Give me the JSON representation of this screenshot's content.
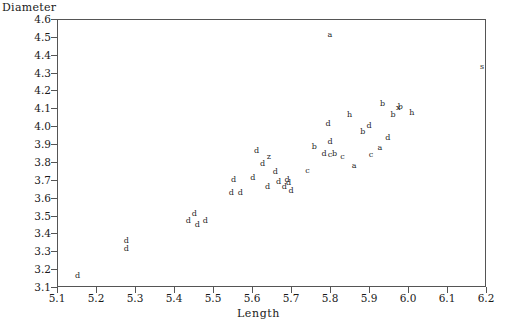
{
  "chart_data": {
    "type": "scatter",
    "title": "",
    "xlabel": "Length",
    "ylabel": "Diameter",
    "xlim": [
      5.1,
      6.2
    ],
    "ylim": [
      3.1,
      4.6
    ],
    "xticks": [
      "5.1",
      "5.2",
      "5.3",
      "5.4",
      "5.5",
      "5.6",
      "5.7",
      "5.8",
      "5.9",
      "6.0",
      "6.1",
      "6.2"
    ],
    "yticks": [
      "3.1",
      "3.2",
      "3.3",
      "3.4",
      "3.5",
      "3.6",
      "3.7",
      "3.8",
      "3.9",
      "4.0",
      "4.1",
      "4.2",
      "4.3",
      "4.4",
      "4.5",
      "4.6"
    ],
    "grid": false,
    "legend": "none",
    "marker_style": "letter-glyph",
    "points": [
      {
        "x": 5.153,
        "y": 3.16,
        "label": "d"
      },
      {
        "x": 5.278,
        "y": 3.355,
        "label": "d"
      },
      {
        "x": 5.278,
        "y": 3.31,
        "label": "d"
      },
      {
        "x": 5.437,
        "y": 3.47,
        "label": "d"
      },
      {
        "x": 5.452,
        "y": 3.508,
        "label": "d"
      },
      {
        "x": 5.46,
        "y": 3.445,
        "label": "d"
      },
      {
        "x": 5.48,
        "y": 3.47,
        "label": "d"
      },
      {
        "x": 5.553,
        "y": 3.7,
        "label": "d"
      },
      {
        "x": 5.547,
        "y": 3.627,
        "label": "d"
      },
      {
        "x": 5.57,
        "y": 3.627,
        "label": "d"
      },
      {
        "x": 5.602,
        "y": 3.712,
        "label": "d"
      },
      {
        "x": 5.627,
        "y": 3.79,
        "label": "d"
      },
      {
        "x": 5.64,
        "y": 3.66,
        "label": "d"
      },
      {
        "x": 5.66,
        "y": 3.745,
        "label": "d"
      },
      {
        "x": 5.668,
        "y": 3.69,
        "label": "d"
      },
      {
        "x": 5.683,
        "y": 3.66,
        "label": "d"
      },
      {
        "x": 5.69,
        "y": 3.7,
        "label": "d"
      },
      {
        "x": 5.694,
        "y": 3.684,
        "label": "d"
      },
      {
        "x": 5.7,
        "y": 3.64,
        "label": "d"
      },
      {
        "x": 5.643,
        "y": 3.825,
        "label": "z"
      },
      {
        "x": 5.612,
        "y": 3.86,
        "label": "d"
      },
      {
        "x": 5.742,
        "y": 3.75,
        "label": "c"
      },
      {
        "x": 5.76,
        "y": 3.885,
        "label": "b"
      },
      {
        "x": 5.785,
        "y": 3.845,
        "label": "d"
      },
      {
        "x": 5.8,
        "y": 3.84,
        "label": "c"
      },
      {
        "x": 5.812,
        "y": 3.845,
        "label": "b"
      },
      {
        "x": 5.8,
        "y": 3.91,
        "label": "d"
      },
      {
        "x": 5.832,
        "y": 3.83,
        "label": "c"
      },
      {
        "x": 5.8,
        "y": 4.51,
        "label": "a"
      },
      {
        "x": 5.795,
        "y": 4.01,
        "label": "d"
      },
      {
        "x": 5.85,
        "y": 4.06,
        "label": "h"
      },
      {
        "x": 5.862,
        "y": 3.78,
        "label": "a"
      },
      {
        "x": 5.884,
        "y": 3.97,
        "label": "b"
      },
      {
        "x": 5.9,
        "y": 4.0,
        "label": "d"
      },
      {
        "x": 5.905,
        "y": 3.84,
        "label": "c"
      },
      {
        "x": 5.928,
        "y": 3.88,
        "label": "a"
      },
      {
        "x": 5.935,
        "y": 4.125,
        "label": "b"
      },
      {
        "x": 5.948,
        "y": 3.935,
        "label": "d"
      },
      {
        "x": 5.962,
        "y": 4.06,
        "label": "b"
      },
      {
        "x": 5.975,
        "y": 4.1,
        "label": "x"
      },
      {
        "x": 5.98,
        "y": 4.105,
        "label": "b"
      },
      {
        "x": 6.01,
        "y": 4.075,
        "label": "h"
      },
      {
        "x": 6.19,
        "y": 4.33,
        "label": "s"
      }
    ]
  }
}
